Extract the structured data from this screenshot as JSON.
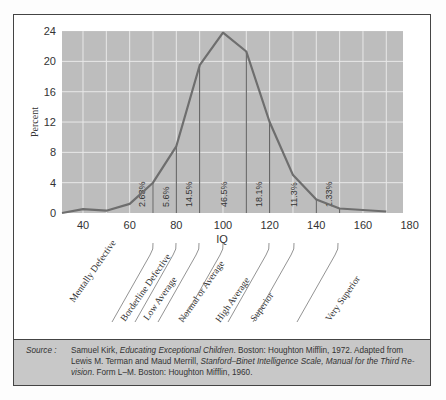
{
  "chart_data": {
    "type": "line",
    "title": "",
    "xlabel": "IQ",
    "ylabel": "Percent",
    "xlim": [
      31,
      180
    ],
    "ylim": [
      0,
      24
    ],
    "x_ticks": [
      40,
      60,
      80,
      100,
      120,
      140,
      160,
      180
    ],
    "y_ticks": [
      0,
      4,
      8,
      12,
      16,
      20,
      24
    ],
    "grid": true,
    "series": [
      {
        "name": "IQ distribution",
        "x": [
          31,
          40,
          50,
          60,
          70,
          80,
          90,
          100,
          110,
          120,
          130,
          140,
          150,
          170
        ],
        "y": [
          0,
          0.5,
          0.3,
          1.2,
          4.0,
          8.8,
          19.5,
          23.8,
          21.3,
          12.0,
          5.0,
          1.8,
          0.6,
          0.2
        ]
      }
    ],
    "dividers": [
      70,
      80,
      90,
      110,
      120,
      140,
      150
    ],
    "band_labels": [
      {
        "x": 65,
        "label": "2.63%"
      },
      {
        "x": 75,
        "label": "5.6%"
      },
      {
        "x": 85,
        "label": "14.5%"
      },
      {
        "x": 100,
        "label": "46.5%"
      },
      {
        "x": 115,
        "label": "18.1%"
      },
      {
        "x": 130,
        "label": "11.3%"
      },
      {
        "x": 145,
        "label": "1.33%"
      }
    ],
    "categories": [
      "Mentally Defective",
      "Borderline Defective",
      "Low Average",
      "Normal or Average",
      "High Average",
      "Superior",
      "Very Superior"
    ]
  },
  "source": {
    "label": "Source :",
    "line1_a": "Samuel Kirk, ",
    "line1_b": "Educating Exceptional Children",
    "line1_c": ".  Boston:  Houghton Mifflin, 1972.  Adapted from",
    "line2_a": "Lewis M. Terman and Maud Merrill, ",
    "line2_b": "Stanford–Binet Intelligence Scale, Manual for the Third Re-",
    "line3_a": "vision",
    "line3_b": ".  Form L–M.  Boston:  Houghton Mifflin, 1960."
  },
  "colors": {
    "plot_bg": "#bdbdbd",
    "grid": "#e8e8e8",
    "curve": "#6e6e6e",
    "divider": "#555555"
  }
}
